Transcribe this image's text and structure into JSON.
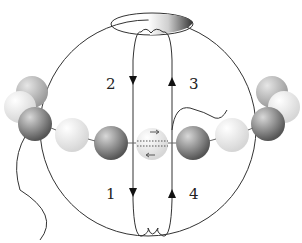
{
  "diagram": {
    "title_partial": "",
    "labels": [
      "1",
      "2",
      "3",
      "4"
    ]
  }
}
